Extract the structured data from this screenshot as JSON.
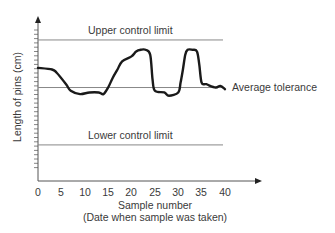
{
  "chart_data": {
    "type": "line",
    "title": "",
    "xlabel": "Sample number",
    "xlabel_sub": "(Date when sample was taken)",
    "ylabel": "Length of pins (cm)",
    "xlim": [
      0,
      40
    ],
    "ylim": [
      0,
      100
    ],
    "x_ticks": [
      "0",
      "5",
      "10",
      "15",
      "20",
      "25",
      "30",
      "35",
      "40"
    ],
    "y_ticks_labeled": false,
    "grid": false,
    "reference_lines": [
      {
        "name": "Upper control limit",
        "value": 86
      },
      {
        "name": "Average tolerance",
        "value": 57
      },
      {
        "name": "Lower control limit",
        "value": 22
      }
    ],
    "series": [
      {
        "name": "Sample pin length",
        "x": [
          0,
          3,
          4,
          6,
          7,
          9,
          11,
          13,
          14,
          15,
          16,
          17,
          18,
          20,
          21,
          22,
          23,
          24,
          24.5,
          25,
          27,
          28,
          30,
          30.5,
          31,
          31.5,
          32,
          33,
          34,
          34.5,
          35,
          36,
          38,
          39,
          40
        ],
        "values": [
          69,
          68,
          66,
          59,
          55,
          53,
          54,
          54,
          53,
          57,
          63,
          68,
          73,
          76,
          79,
          80,
          80,
          77,
          62,
          55,
          54,
          52,
          54,
          60,
          68,
          77,
          80,
          80,
          79,
          71,
          60,
          59,
          57,
          58,
          56
        ]
      }
    ]
  },
  "labels": {
    "upper": "Upper control limit",
    "average": "Average tolerance",
    "lower": "Lower control limit",
    "ylabel": "Length of pins (cm)",
    "xlabel": "Sample number",
    "xlabel_sub": "(Date when sample was taken)",
    "xticks": [
      "0",
      "5",
      "10",
      "15",
      "20",
      "25",
      "30",
      "35",
      "40"
    ]
  },
  "colors": {
    "axis": "#555555",
    "reference": "#777777",
    "curve": "#1a1a1a",
    "text": "#3a3a3a"
  }
}
